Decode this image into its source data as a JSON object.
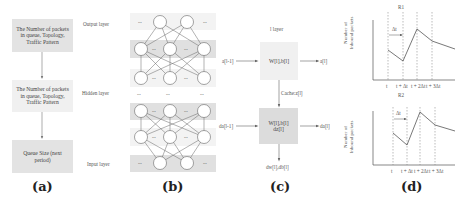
{
  "panel_a": {
    "label": "(a)",
    "boxes": [
      {
        "text": "The Number of packets in queue, Topology, Traffic Pattern",
        "color": "#e3e3e3"
      },
      {
        "text": "The Number of packets in queue, Topology, Traffic Pattern",
        "color": "#f0f0f0"
      },
      {
        "text": "Queue Size (next period)",
        "color": "#e3e3e3"
      }
    ],
    "layer_labels": {
      "output": "Output layer",
      "hidden": "Hidden layer",
      "input": "Input layer"
    }
  },
  "panel_b": {
    "label": "(b)",
    "ellipsis": "...",
    "band_color": "#e0e0e0",
    "light_band_color": "#f3f3f3"
  },
  "panel_c": {
    "label": "(c)",
    "layer_title": "l layer",
    "forward_input": "a[l-1]",
    "forward_box": "W[l],b[l]",
    "forward_output": "a[l]",
    "cache_label": "Cache:z[l]",
    "backward_input": "da[l-1]",
    "backward_box_line1": "W[l],b[l]",
    "backward_box_line2": "dz[l]",
    "backward_output": "da[l]",
    "gradients_output": "dw[l],db[l]",
    "forward_box_color": "#f0f0f0",
    "backward_box_color": "#dcdcdc"
  },
  "panel_d": {
    "label": "(d)",
    "charts": [
      {
        "title": "R1",
        "ylabel_line1": "Number of",
        "ylabel_line2": "Inbound packets",
        "delta_label": "Δt",
        "x_ticks": [
          "t",
          "t + Δt",
          "t + 2Δt",
          "t + 3Δt"
        ]
      },
      {
        "title": "R2",
        "ylabel_line1": "Number of",
        "ylabel_line2": "Inbound packets",
        "delta_label": "Δt",
        "x_ticks": [
          "t",
          "t + Δt",
          "t + 2Δt",
          "t + 3Δt"
        ]
      }
    ]
  }
}
